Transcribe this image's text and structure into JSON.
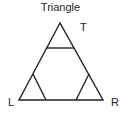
{
  "title": "Triangle",
  "labels": {
    "top": "T",
    "left": "L",
    "right": "R"
  },
  "colors": {
    "stroke": "#222222",
    "background": "#ffffff"
  }
}
